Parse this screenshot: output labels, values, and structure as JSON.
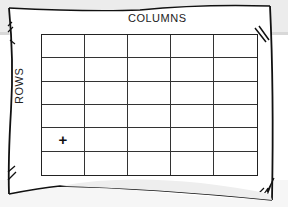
{
  "diagram": {
    "column_label": "COLUMNS",
    "row_label": "ROWS",
    "grid": {
      "columns": 5,
      "rows": 6,
      "marker": {
        "symbol": "+",
        "row": 5,
        "column": 1
      }
    }
  },
  "colors": {
    "line": "#222222",
    "paper": "#ffffff",
    "background": "#ececec"
  }
}
